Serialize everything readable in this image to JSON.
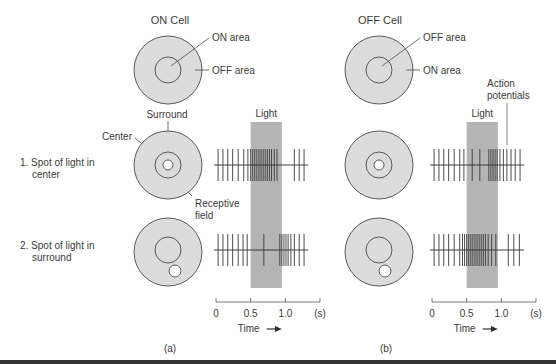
{
  "figure": {
    "panel_a": {
      "caption": "(a)",
      "cell_title": "ON Cell",
      "center_label": "ON area",
      "surround_label": "OFF area",
      "annotations": {
        "surround": "Surround",
        "center": "Center",
        "receptive_field_line1": "Receptive",
        "receptive_field_line2": "field",
        "light": "Light"
      },
      "rows": [
        {
          "label_line1": "1. Spot of light in",
          "label_line2": "center",
          "spot_location": "center",
          "spike_times_s": [
            0.03,
            0.1,
            0.17,
            0.24,
            0.32,
            0.4,
            0.46,
            0.5,
            0.53,
            0.56,
            0.59,
            0.62,
            0.65,
            0.68,
            0.71,
            0.74,
            0.77,
            0.8,
            0.84,
            0.88,
            1.13,
            1.2,
            1.27
          ]
        },
        {
          "label_line1": "2. Spot of light in",
          "label_line2": "surround",
          "spot_location": "surround",
          "spike_times_s": [
            0.03,
            0.1,
            0.17,
            0.24,
            0.32,
            0.39,
            0.45,
            0.69,
            0.92,
            0.95,
            0.98,
            1.01,
            1.04,
            1.08,
            1.13,
            1.2,
            1.27
          ]
        }
      ]
    },
    "panel_b": {
      "caption": "(b)",
      "cell_title": "OFF Cell",
      "center_label": "OFF area",
      "surround_label": "ON area",
      "annotations": {
        "action_potentials_line1": "Action",
        "action_potentials_line2": "potentials",
        "light": "Light"
      },
      "rows": [
        {
          "spot_location": "center",
          "spike_times_s": [
            0.03,
            0.1,
            0.17,
            0.24,
            0.32,
            0.4,
            0.46,
            0.58,
            0.69,
            0.82,
            0.85,
            0.88,
            0.91,
            0.94,
            0.98,
            1.03,
            1.08,
            1.14,
            1.2,
            1.27
          ]
        },
        {
          "spot_location": "surround",
          "spike_times_s": [
            0.03,
            0.1,
            0.17,
            0.24,
            0.32,
            0.4,
            0.44,
            0.47,
            0.5,
            0.53,
            0.56,
            0.59,
            0.62,
            0.65,
            0.68,
            0.71,
            0.74,
            0.77,
            0.81,
            0.86,
            0.92,
            1.1,
            1.18,
            1.26
          ]
        }
      ]
    },
    "time_axis": {
      "ticks": [
        {
          "value": 0,
          "label": "0"
        },
        {
          "value": 0.5,
          "label": "0.5"
        },
        {
          "value": 1.0,
          "label": "1.0"
        },
        {
          "value": 1.5,
          "label": "(s)"
        }
      ],
      "label": "Time",
      "arrow": "→",
      "range": [
        0,
        1.5
      ],
      "light_on_s": [
        0.5,
        0.95
      ]
    },
    "colors": {
      "cell_fill": "#dcdcdc",
      "light_band": "#b4b4b4",
      "stroke": "#4a4a4a",
      "spot_fill": "#ffffff"
    }
  }
}
